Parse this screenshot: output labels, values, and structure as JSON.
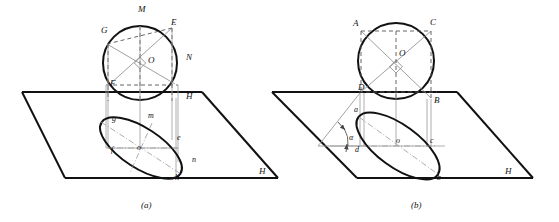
{
  "figure": {
    "type": "technical-drawing",
    "plane_label": "H",
    "captions": {
      "left": "(a)",
      "right": "(b)"
    }
  },
  "panel_a": {
    "caption": "(a)",
    "plane_label": "H",
    "circle_center_label": "O",
    "upper_labels": [
      {
        "text": "M",
        "x": 138,
        "y": 12
      },
      {
        "text": "G",
        "x": 101,
        "y": 33
      },
      {
        "text": "E",
        "x": 171,
        "y": 25
      },
      {
        "text": "N",
        "x": 186,
        "y": 60
      },
      {
        "text": "O",
        "x": 148,
        "y": 63
      },
      {
        "text": "F",
        "x": 110,
        "y": 86
      },
      {
        "text": "H",
        "x": 186,
        "y": 99
      }
    ],
    "lower_labels": [
      {
        "text": "g",
        "x": 112,
        "y": 121
      },
      {
        "text": "m",
        "x": 148,
        "y": 118
      },
      {
        "text": "f",
        "x": 111,
        "y": 152
      },
      {
        "text": "o",
        "x": 137,
        "y": 150
      },
      {
        "text": "e",
        "x": 177,
        "y": 140
      },
      {
        "text": "n",
        "x": 192,
        "y": 162
      },
      {
        "text": "h",
        "x": 175,
        "y": 180
      }
    ]
  },
  "panel_b": {
    "caption": "(b)",
    "plane_label": "H",
    "circle_center_label": "O",
    "angle_label": "α",
    "upper_labels": [
      {
        "text": "A",
        "x": 353,
        "y": 26
      },
      {
        "text": "C",
        "x": 430,
        "y": 25
      },
      {
        "text": "O",
        "x": 399,
        "y": 56
      },
      {
        "text": "D",
        "x": 358,
        "y": 90
      },
      {
        "text": "B",
        "x": 434,
        "y": 103
      }
    ],
    "lower_labels": [
      {
        "text": "a",
        "x": 354,
        "y": 112
      },
      {
        "text": "d",
        "x": 355,
        "y": 149
      },
      {
        "text": "o",
        "x": 396,
        "y": 142
      },
      {
        "text": "c",
        "x": 430,
        "y": 142
      },
      {
        "text": "b",
        "x": 437,
        "y": 180
      }
    ]
  }
}
